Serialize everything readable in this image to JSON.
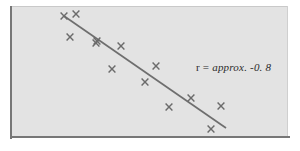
{
  "figure": {
    "background_color": "#ffffff",
    "panel_color": "#e3e3e3",
    "axis_color": "#777777",
    "marker_color": "#6b6b6b",
    "line_color": "#6e6e6e"
  },
  "annotation": {
    "symbol": "r",
    "equals": "=",
    "value": "approx. -0. 8",
    "full_text": "r = approx. -0. 8"
  },
  "chart_data": {
    "type": "scatter",
    "title": "",
    "xlabel": "",
    "ylabel": "",
    "grid": false,
    "legend": null,
    "annotations": [
      {
        "text": "r = approx. -0. 8",
        "x_px": 196,
        "y_px": 61
      }
    ],
    "correlation": -0.8,
    "correlation_label": "r = approx. -0. 8",
    "marker_symbol": "x",
    "n_points": 13,
    "axis_ranges": {
      "x_px": [
        10,
        288
      ],
      "y_px": [
        6,
        137
      ]
    },
    "points_px": [
      {
        "x": 76,
        "y": 14
      },
      {
        "x": 70,
        "y": 37
      },
      {
        "x": 96,
        "y": 43
      },
      {
        "x": 121,
        "y": 46
      },
      {
        "x": 112,
        "y": 69
      },
      {
        "x": 156,
        "y": 66
      },
      {
        "x": 145,
        "y": 82
      },
      {
        "x": 191,
        "y": 98
      },
      {
        "x": 169,
        "y": 107
      },
      {
        "x": 221,
        "y": 106
      },
      {
        "x": 211,
        "y": 129
      },
      {
        "x": 64,
        "y": 16
      },
      {
        "x": 97,
        "y": 41
      }
    ],
    "fit_line_px": {
      "x1": 64,
      "y1": 16,
      "x2": 226,
      "y2": 128
    },
    "fit_line_description": "negative-slope straight trend line"
  }
}
